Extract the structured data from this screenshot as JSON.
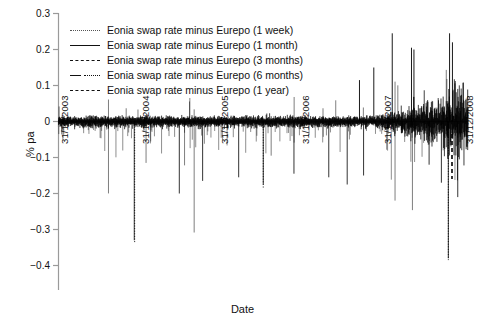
{
  "chart_data": {
    "type": "line",
    "title": "",
    "xlabel": "Date",
    "ylabel": "% pa",
    "ylim": [
      -0.4,
      0.3
    ],
    "yticks": [
      0.3,
      0.2,
      0.1,
      0,
      -0.1,
      -0.2,
      -0.3,
      -0.4
    ],
    "ytick_labels": [
      "0.3",
      "0.2",
      "0.1",
      "0",
      "−0.1",
      "−0.2",
      "−0.3",
      "−0.4"
    ],
    "xticks": [
      "31/12/2003",
      "31/12/2004",
      "31/12/2005",
      "31/12/2006",
      "31/12/2007",
      "31/12/2008"
    ],
    "grid": false,
    "legend_position": "top-left",
    "legend": [
      {
        "label": "Eonia swap rate minus Eurepo (1 week)",
        "style": "dotted"
      },
      {
        "label": "Eonia swap rate minus Eurepo (1 month)",
        "style": "solid"
      },
      {
        "label": "Eonia swap rate minus Eurepo (3 months)",
        "style": "dashed"
      },
      {
        "label": "Eonia swap rate minus Eurepo (6 months)",
        "style": "dashdot"
      },
      {
        "label": "Eonia swap rate minus Eurepo (1 year)",
        "style": "dashed2"
      }
    ],
    "series": [
      {
        "name": "Eonia swap rate minus Eurepo (1 week)",
        "style": "dotted",
        "note": "High-frequency daily spread, near zero 2003-2007, extreme negative spikes to -0.33 in 2005 and large positive/negative excursions reaching +0.25 and -0.38 during late 2008",
        "values": [
          0.01,
          0.02,
          0.0,
          0.01,
          -0.01,
          0.0,
          0.02,
          -0.02,
          0.01,
          0.0,
          0.03,
          -0.03,
          0.0,
          0.01,
          -0.05,
          0.02,
          0.0,
          -0.01,
          0.04,
          -0.04,
          0.01,
          0.0,
          0.02,
          -0.33,
          0.01,
          0.0,
          -0.02,
          0.03,
          0.0,
          -0.06,
          0.02,
          0.01,
          0.0,
          -0.03,
          0.05,
          0.0,
          -0.02,
          0.01,
          0.09,
          -0.04,
          0.02,
          0.0,
          0.14,
          -0.05,
          0.03,
          0.25,
          -0.09,
          0.04,
          0.02,
          -0.12,
          0.2,
          -0.38,
          0.06,
          -0.14,
          0.02
        ]
      },
      {
        "name": "Eonia swap rate minus Eurepo (1 month)",
        "style": "solid",
        "note": "Dense black band oscillating tightly about zero with amplitude ~0.02, widening after mid-2007",
        "values": [
          0.005,
          0.01,
          0.0,
          -0.005,
          0.008,
          0.0,
          -0.01,
          0.012,
          0.0,
          -0.008,
          0.01,
          0.002,
          -0.012,
          0.015,
          0.0,
          -0.01,
          0.02,
          0.0,
          -0.015,
          0.018,
          0.0,
          -0.012,
          0.025,
          -0.02,
          0.01,
          0.03,
          -0.03,
          0.02,
          0.04,
          -0.05,
          0.03,
          0.06,
          -0.08,
          0.05,
          0.02,
          -0.1,
          0.04,
          -0.12,
          0.03
        ]
      },
      {
        "name": "Eonia swap rate minus Eurepo (3 months)",
        "style": "dashed",
        "note": "Overlaid within the same dense band near zero"
      },
      {
        "name": "Eonia swap rate minus Eurepo (6 months)",
        "style": "dashdot",
        "note": "Overlaid within the same dense band near zero"
      },
      {
        "name": "Eonia swap rate minus Eurepo (1 year)",
        "style": "dashed2",
        "note": "Overlaid within the same dense band near zero, visible dashed segment near end-2008"
      }
    ]
  }
}
